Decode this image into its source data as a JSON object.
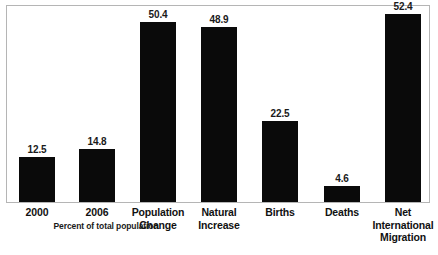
{
  "chart_data": {
    "type": "bar",
    "title": "",
    "subtitle": "",
    "xlabel": "",
    "ylabel": "",
    "axis_note": "Percent of total population",
    "grid": false,
    "legend": "none",
    "ylim": [
      0,
      55
    ],
    "bar_color": "#0a0a0a",
    "frame_color": "#b5b5b5",
    "background": "#ffffff",
    "categories": [
      "2000",
      "2006",
      "Population Change",
      "Natural Increase",
      "Births",
      "Deaths",
      "Net International Migration"
    ],
    "category_lines": [
      [
        "2000"
      ],
      [
        "2006"
      ],
      [
        "Population",
        "Change"
      ],
      [
        "Natural",
        "Increase"
      ],
      [
        "Births"
      ],
      [
        "Deaths"
      ],
      [
        "Net",
        "International",
        "Migration"
      ]
    ],
    "values": [
      12.5,
      14.8,
      50.4,
      48.9,
      22.5,
      4.6,
      52.4
    ],
    "value_labels": [
      "12.5",
      "14.8",
      "50.4",
      "48.9",
      "22.5",
      "4.6",
      "52.4"
    ]
  }
}
